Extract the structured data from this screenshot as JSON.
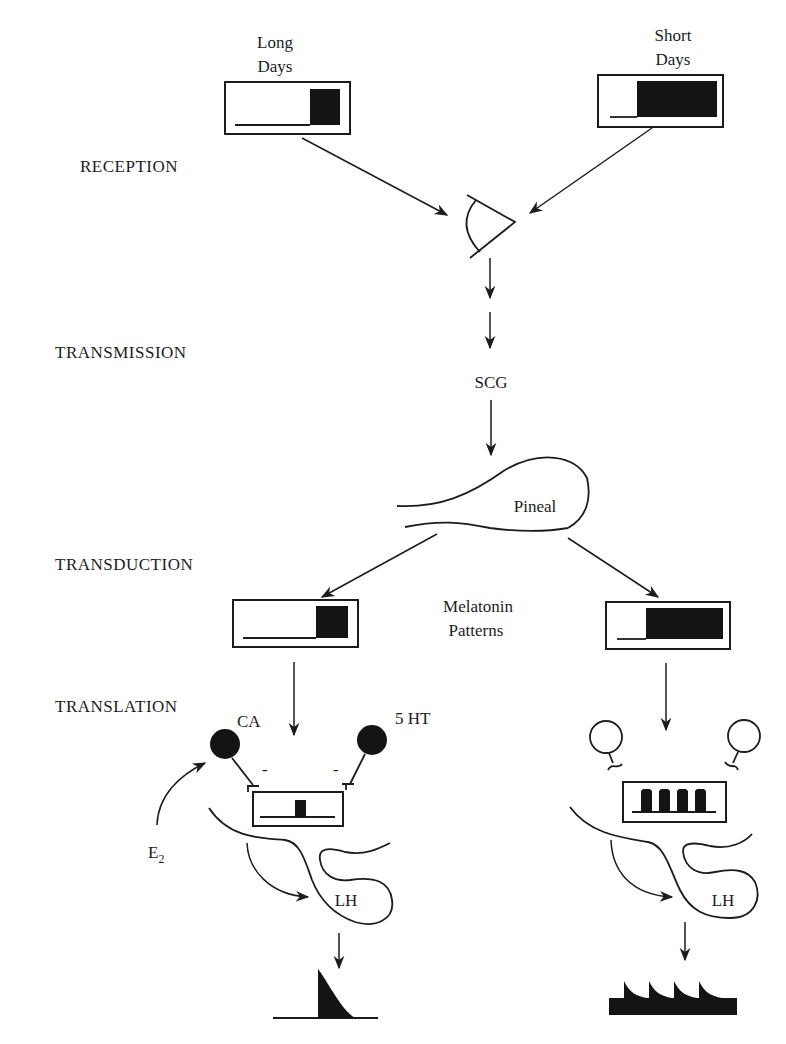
{
  "stages": [
    "RECEPTION",
    "TRANSMISSION",
    "TRANSDUCTION",
    "TRANSLATION"
  ],
  "photoperiods": {
    "long": {
      "line1": "Long",
      "line2": "Days",
      "dark_fraction": 0.2
    },
    "short": {
      "line1": "Short",
      "line2": "Days",
      "dark_fraction": 0.7
    }
  },
  "nodes": {
    "eye": "eye",
    "scg": "SCG",
    "pineal": "Pineal",
    "melatonin_line1": "Melatonin",
    "melatonin_line2": "Patterns",
    "ca": "CA",
    "ht": "5 HT",
    "e2": "E",
    "e2_sub": "2",
    "lh_left": "LH",
    "lh_right": "LH",
    "inhibit_left": "-",
    "inhibit_right": "-"
  },
  "melatonin": {
    "long_dark_fraction": 0.25,
    "short_dark_fraction": 0.65
  },
  "gnrh": {
    "long_pulses": 1,
    "short_pulses": 4
  },
  "lh_output": {
    "long_pulses": 1,
    "short_pulses": 4
  }
}
